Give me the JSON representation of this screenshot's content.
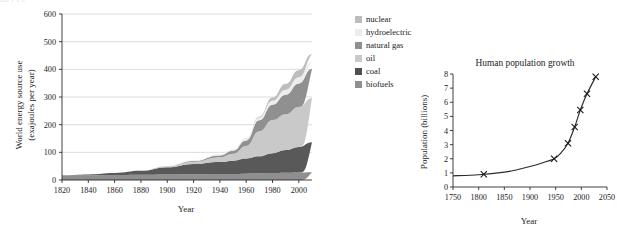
{
  "page": {
    "background": "#ffffff",
    "top_cropped_text": "dd   f f    c"
  },
  "chart_data": [
    {
      "id": "energy",
      "type": "area",
      "title": "",
      "xlabel": "Year",
      "ylabel": "World energy source use\n(exajoules per year)",
      "ylabel_line1": "World energy source use",
      "ylabel_line2": "(exajoules per year)",
      "xlim": [
        1820,
        2010
      ],
      "ylim": [
        0,
        600
      ],
      "xticks": [
        1820,
        1840,
        1860,
        1880,
        1900,
        1920,
        1940,
        1960,
        1980,
        2000
      ],
      "yticks": [
        0,
        100,
        200,
        300,
        400,
        500,
        600
      ],
      "grid": "horizontal",
      "stacked": true,
      "legend_position": "right",
      "x": [
        1820,
        1840,
        1860,
        1880,
        1900,
        1920,
        1940,
        1950,
        1960,
        1970,
        1980,
        1990,
        2000,
        2010
      ],
      "series": [
        {
          "name": "biofuels",
          "color": "#8f8f8f",
          "values": [
            16,
            17,
            18,
            19,
            20,
            21,
            22,
            22,
            23,
            24,
            25,
            26,
            27,
            28
          ]
        },
        {
          "name": "coal",
          "color": "#595959",
          "values": [
            1,
            3,
            7,
            14,
            26,
            37,
            43,
            48,
            55,
            62,
            72,
            82,
            92,
            108
          ]
        },
        {
          "name": "oil",
          "color": "#c9c9c9",
          "values": [
            0,
            0,
            0,
            1,
            3,
            8,
            17,
            25,
            45,
            90,
            120,
            130,
            145,
            160
          ]
        },
        {
          "name": "natural gas",
          "color": "#909090",
          "values": [
            0,
            0,
            0,
            0,
            1,
            3,
            7,
            11,
            20,
            40,
            55,
            70,
            85,
            105
          ]
        },
        {
          "name": "hydroelectric",
          "color": "#ededed",
          "values": [
            0,
            0,
            0,
            0,
            1,
            2,
            4,
            5,
            7,
            10,
            14,
            18,
            22,
            26
          ]
        },
        {
          "name": "nuclear",
          "color": "#bdbdbd",
          "values": [
            0,
            0,
            0,
            0,
            0,
            0,
            0,
            0,
            1,
            3,
            12,
            22,
            26,
            28
          ]
        }
      ]
    },
    {
      "id": "population",
      "type": "line",
      "title": "Human population growth",
      "xlabel": "Year",
      "ylabel": "Population (billions)",
      "xlim": [
        1750,
        2050
      ],
      "ylim": [
        0,
        8
      ],
      "xticks": [
        1750,
        1800,
        1850,
        1900,
        1950,
        2000,
        2050
      ],
      "yticks": [
        0,
        1,
        2,
        3,
        4,
        5,
        6,
        7,
        8
      ],
      "grid": "none",
      "marker": "x",
      "line_color": "#2b2b2b",
      "points": [
        {
          "x": 1810,
          "y": 0.9
        },
        {
          "x": 1947,
          "y": 2.0
        },
        {
          "x": 1974,
          "y": 3.1
        },
        {
          "x": 1987,
          "y": 4.25
        },
        {
          "x": 1998,
          "y": 5.45
        },
        {
          "x": 2011,
          "y": 6.6
        },
        {
          "x": 2028,
          "y": 7.8
        }
      ],
      "curve": [
        {
          "x": 1750,
          "y": 0.79
        },
        {
          "x": 1800,
          "y": 0.87
        },
        {
          "x": 1850,
          "y": 1.05
        },
        {
          "x": 1875,
          "y": 1.22
        },
        {
          "x": 1900,
          "y": 1.45
        },
        {
          "x": 1925,
          "y": 1.72
        },
        {
          "x": 1947,
          "y": 2.0
        },
        {
          "x": 1960,
          "y": 2.4
        },
        {
          "x": 1974,
          "y": 3.1
        },
        {
          "x": 1987,
          "y": 4.25
        },
        {
          "x": 1998,
          "y": 5.45
        },
        {
          "x": 2011,
          "y": 6.6
        },
        {
          "x": 2028,
          "y": 7.8
        }
      ]
    }
  ],
  "energy_chart": {
    "ylabel_line1": "World energy source use",
    "ylabel_line2": "(exajoules per year)",
    "xlabel": "Year",
    "yticks": [
      "600",
      "500",
      "400",
      "300",
      "200",
      "100",
      "0"
    ],
    "xticks": [
      "1820",
      "1840",
      "1860",
      "1880",
      "1900",
      "1920",
      "1940",
      "1960",
      "1980",
      "2000"
    ]
  },
  "legend": {
    "items": [
      {
        "label": "nuclear",
        "color": "#bdbdbd"
      },
      {
        "label": "hydroelectric",
        "color": "#ededed"
      },
      {
        "label": "natural gas",
        "color": "#909090"
      },
      {
        "label": "oil",
        "color": "#c9c9c9"
      },
      {
        "label": "coal",
        "color": "#4f4f4f"
      },
      {
        "label": "biofuels",
        "color": "#8f8f8f"
      }
    ]
  },
  "population_chart": {
    "title": "Human population growth",
    "ylabel": "Population (billions)",
    "xlabel": "Year",
    "yticks": [
      "8",
      "7",
      "6",
      "5",
      "4",
      "3",
      "2",
      "1",
      "0"
    ],
    "xticks": [
      "1750",
      "1800",
      "1850",
      "1900",
      "1950",
      "2000",
      "2050"
    ]
  }
}
